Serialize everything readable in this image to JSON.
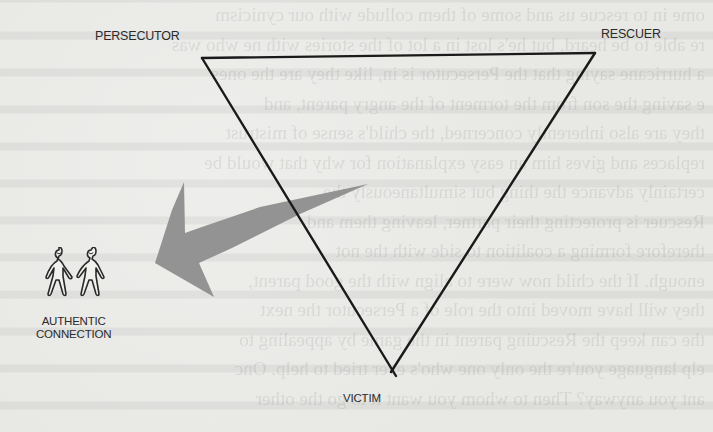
{
  "diagram": {
    "vertices": {
      "persecutor": {
        "label": "PERSECUTOR",
        "x": 202,
        "y": 58
      },
      "rescuer": {
        "label": "RESCUER",
        "x": 595,
        "y": 53
      },
      "victim": {
        "label": "VICTIM",
        "x": 393,
        "y": 372
      }
    },
    "exit": {
      "label_line1": "AUTHENTIC",
      "label_line2": "CONNECTION",
      "icon": "two-people-holding-hands-icon"
    },
    "arrow": {
      "from": "triangle",
      "to": "authentic-connection",
      "color": "#8e8e8e"
    },
    "colors": {
      "line": "#1a1a1a",
      "text": "#2b2b2b",
      "arrow": "#8e8e8e",
      "paper": "#e8e8e5"
    }
  },
  "background_bleed_text": [
    "ome in to rescue us and some of them collude with our cynicism",
    "re able to be heard, but he's lost in a lot of the stories with ne who was",
    "a hurricane saying that the Persecutor is in, like they are the ones",
    "e saving the son from the torment of the angry parent, and",
    "they are also inherently concerned, the child's sense of mistrust",
    "replaces and gives him an easy explanation for why that would be",
    "certainly advance the thing but simultaneously the",
    "Rescuer is protecting their partner, leaving them and",
    "therefore forming a coalition to side with the not",
    "enough. If the child now were to align with the good parent,",
    "they will have moved into the role of a Persecutor the next",
    "the can keep the Rescuing parent in the game by appealing to",
    "elp language you're the only one who's ever tried to help. Onc",
    "ant you anyway? Then to whom you want it to go the other"
  ]
}
